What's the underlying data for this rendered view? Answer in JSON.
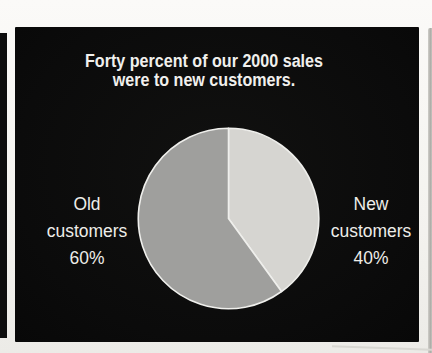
{
  "chart_data": {
    "type": "pie",
    "title": "Forty percent of our 2000 sales were to new customers.",
    "title_lines": [
      "Forty percent of our 2000 sales",
      "were to new customers."
    ],
    "start_angle_deg": 0,
    "direction": "clockwise",
    "outline_color": "#efefec",
    "slide_background": "#0b0b0b",
    "text_color": "#f1f0ed",
    "slices": [
      {
        "label": "New customers",
        "pct": 40,
        "color": "#d6d5d1",
        "label_lines": [
          "New",
          "customers",
          "40%"
        ],
        "label_side": "right"
      },
      {
        "label": "Old customers",
        "pct": 60,
        "color": "#9f9f9d",
        "label_lines": [
          "Old",
          "customers",
          "60%"
        ],
        "label_side": "left"
      }
    ],
    "legend_position": "side-callouts",
    "grid": false
  }
}
